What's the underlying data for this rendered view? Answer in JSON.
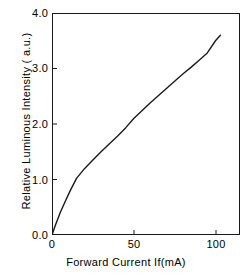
{
  "chart_data": {
    "type": "line",
    "title": "",
    "xlabel": "Forward Current  If(mA)",
    "ylabel": "Relative Luminous Intensity ( a.u.)",
    "xlim": [
      0,
      115
    ],
    "ylim": [
      0.0,
      4.0
    ],
    "xticks": [
      0,
      50,
      100
    ],
    "xticklabels": [
      "0",
      "50",
      "100"
    ],
    "yticks": [
      0.0,
      1.0,
      2.0,
      3.0,
      4.0
    ],
    "yticklabels": [
      "0.0",
      "1.0",
      "2.0",
      "3.0",
      "4.0"
    ],
    "grid": false,
    "legend": null,
    "series": [
      {
        "name": "Relative Luminous Intensity",
        "color": "#1a1a1a",
        "x": [
          0,
          2,
          5,
          8,
          11,
          15,
          20,
          25,
          30,
          35,
          40,
          45,
          50,
          55,
          60,
          65,
          70,
          75,
          80,
          85,
          90,
          95,
          100,
          103
        ],
        "y": [
          0.0,
          0.17,
          0.4,
          0.6,
          0.79,
          1.02,
          1.2,
          1.35,
          1.5,
          1.64,
          1.78,
          1.93,
          2.1,
          2.24,
          2.38,
          2.51,
          2.64,
          2.77,
          2.9,
          3.02,
          3.15,
          3.28,
          3.5,
          3.6
        ]
      }
    ]
  },
  "axes": {
    "y_tick_labels": [
      "4.0",
      "3.0",
      "2.0",
      "1.0",
      "0.0"
    ],
    "x_tick_labels": [
      "0",
      "50",
      "100"
    ],
    "x_title": "Forward Current  If(mA)",
    "y_title": "Relative Luminous Intensity ( a.u.)"
  }
}
